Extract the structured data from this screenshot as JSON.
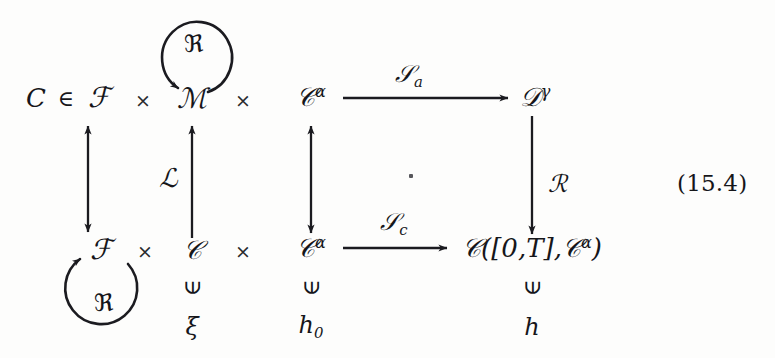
{
  "figure": {
    "kind": "commutative-diagram",
    "equation_number": "(15.4)",
    "center_dot": "."
  },
  "nodes": {
    "c_elem": "C",
    "elem_of": "∈",
    "F_top": "ℱ",
    "times_1": "×",
    "M_top": "ℳ",
    "times_2": "×",
    "Calpha_top_base": "𝒞",
    "Calpha_top_sup": "α",
    "Dgamma_base": "𝒟",
    "Dgamma_sup": "γ",
    "F_bottom": "ℱ",
    "times_3": "×",
    "C_bottom": "𝒞",
    "times_4": "×",
    "Calpha_bottom_base": "𝒞",
    "Calpha_bottom_sup": "α",
    "CT_space": "𝒞([0,T],𝒞",
    "CT_space_sup": "α",
    "CT_space_close": ")"
  },
  "arrow_labels": {
    "S_a_base": "𝒮",
    "S_a_sub": "a",
    "S_c_base": "𝒮",
    "S_c_sub": "c",
    "L_script": "ℒ",
    "R_script": "ℛ",
    "frak_R_top": "ℜ",
    "frak_R_bottom": "ℜ"
  },
  "membership": {
    "symbol": "∈",
    "xi": "ξ",
    "h0_base": "h",
    "h0_sub": "0",
    "h": "h"
  },
  "colors": {
    "ink": "#16161a",
    "paper": "#fdfdfc",
    "arrow": "#1b1b20"
  }
}
